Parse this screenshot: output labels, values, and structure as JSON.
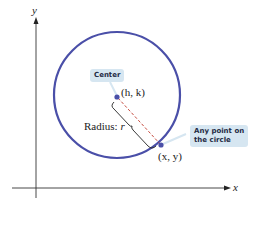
{
  "diagram": {
    "axes": {
      "x_label": "x",
      "y_label": "y"
    },
    "circle": {
      "stroke_color": "#4a4fa8",
      "center_px": [
        117,
        95
      ],
      "radius_px": 63
    },
    "center_point": {
      "label": "(h, k)",
      "callout": "Center"
    },
    "circle_point": {
      "label": "(x, y)",
      "callout_line1": "Any point on",
      "callout_line2": "the circle"
    },
    "radius": {
      "label_prefix": "Radius: ",
      "label_var": "r",
      "dash_color": "#c0392b"
    }
  }
}
